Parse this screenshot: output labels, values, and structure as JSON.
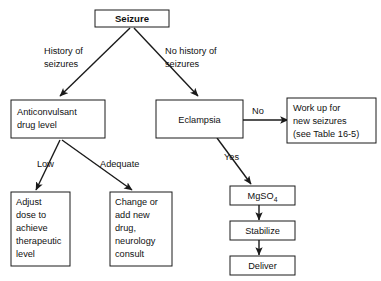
{
  "diagram": {
    "type": "flowchart",
    "colors": {
      "background": "#ffffff",
      "box_fill": "#ffffff",
      "stroke": "#1a1a1a",
      "text": "#111111"
    },
    "nodes": {
      "seizure": {
        "label": "Seizure",
        "lines": [
          "Seizure"
        ],
        "bold": true
      },
      "anticonvulsant": {
        "label": "Anticonvulsant drug level",
        "lines": [
          "Anticonvulsant",
          "drug level"
        ]
      },
      "eclampsia": {
        "label": "Eclampsia",
        "lines": [
          "Eclampsia"
        ]
      },
      "workup": {
        "label": "Work up for new seizures (see Table 16-5)",
        "lines": [
          "Work up for",
          "new seizures",
          "(see Table 16-5)"
        ]
      },
      "adjust_dose": {
        "label": "Adjust dose to achieve therapeutic level",
        "lines": [
          "Adjust",
          "dose to",
          "achieve",
          "therapeutic",
          "level"
        ]
      },
      "change_drug": {
        "label": "Change or add new drug, neurology consult",
        "lines": [
          "Change or",
          "add new",
          "drug,",
          "neurology",
          "consult"
        ]
      },
      "mgso4": {
        "label": "MgSO4",
        "base": "MgSO",
        "subscript": "4"
      },
      "stabilize": {
        "label": "Stabilize",
        "lines": [
          "Stabilize"
        ]
      },
      "deliver": {
        "label": "Deliver",
        "lines": [
          "Deliver"
        ]
      }
    },
    "edge_labels": {
      "history_of_seizures": [
        "History of",
        "seizures"
      ],
      "no_history_of_seizures": [
        "No history of",
        "seizures"
      ],
      "no": "No",
      "yes": "Yes",
      "low": "Low",
      "adequate": "Adequate"
    }
  }
}
